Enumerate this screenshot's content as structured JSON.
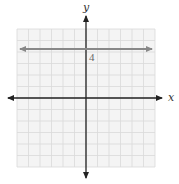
{
  "chart_data": {
    "type": "line",
    "title": "",
    "xlabel": "x",
    "ylabel": "y",
    "xlim": [
      -6,
      6
    ],
    "ylim": [
      -6,
      6
    ],
    "grid": true,
    "series": [
      {
        "name": "y = 4",
        "equation": "y = 4",
        "x": [
          -6,
          6
        ],
        "y": [
          4,
          4
        ],
        "color": "#888888"
      }
    ],
    "annotations": [
      {
        "text": "4",
        "x": 0,
        "y": 4
      }
    ]
  },
  "labels": {
    "x_axis": "x",
    "y_axis": "y",
    "line_value": "4"
  },
  "colors": {
    "grid": "#d9d9d9",
    "grid_bg": "#f4f4f4",
    "axis": "#222222",
    "line": "#888888"
  }
}
